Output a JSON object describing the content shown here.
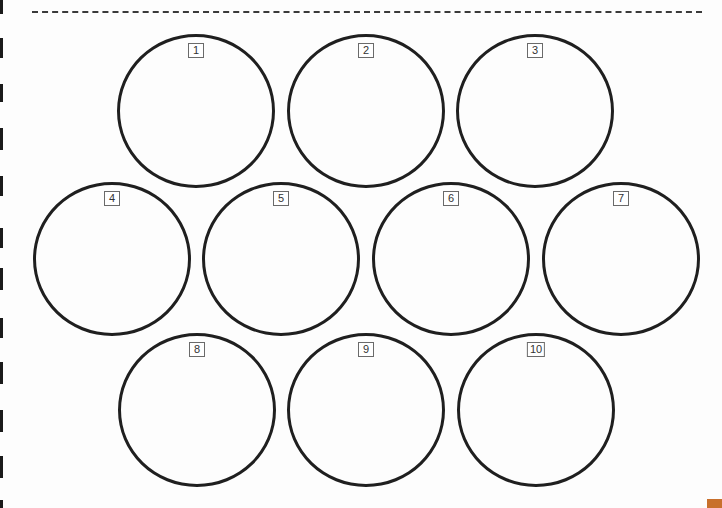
{
  "sheet": {
    "background": "#fdfdfd",
    "cut_line": {
      "style": "dashed",
      "color": "#3a3a3a"
    },
    "corner_tab_color": "#c8702c"
  },
  "circles": [
    {
      "label": "1"
    },
    {
      "label": "2"
    },
    {
      "label": "3"
    },
    {
      "label": "4"
    },
    {
      "label": "5"
    },
    {
      "label": "6"
    },
    {
      "label": "7"
    },
    {
      "label": "8"
    },
    {
      "label": "9"
    },
    {
      "label": "10"
    }
  ]
}
